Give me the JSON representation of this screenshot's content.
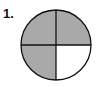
{
  "problem": {
    "number_label": "1.",
    "figure": {
      "shape": "circle",
      "total_parts": 4,
      "shaded_parts": 3,
      "shaded_color": "#a9a9a9",
      "unshaded_color": "#ffffff",
      "outline_color": "#111111",
      "parts": [
        {
          "position": "top-left",
          "shaded": true
        },
        {
          "position": "top-right",
          "shaded": true
        },
        {
          "position": "bottom-left",
          "shaded": true
        },
        {
          "position": "bottom-right",
          "shaded": false
        }
      ]
    }
  }
}
